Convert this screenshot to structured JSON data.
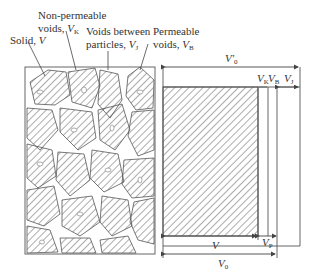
{
  "diagram": {
    "left_panel": {
      "title": "Particle packing (schematic)",
      "labels": {
        "solid": {
          "text": "Solid, ",
          "symbol": "V",
          "sub": ""
        },
        "non_permeable": {
          "line1": "Non-permeable",
          "line2": "voids, ",
          "symbol": "V",
          "sub": "K"
        },
        "voids_between": {
          "line1": "Voids between",
          "line2": "particles, ",
          "symbol": "V",
          "sub": "J"
        },
        "permeable": {
          "line1": "Permeable",
          "line2": "voids, ",
          "symbol": "V",
          "sub": "B"
        }
      }
    },
    "right_panel": {
      "top_dimension": {
        "symbol": "V'",
        "sub": "0"
      },
      "small_dimensions": [
        {
          "symbol": "V",
          "sub": "K"
        },
        {
          "symbol": "V",
          "sub": "B"
        },
        {
          "symbol": "V",
          "sub": "J"
        }
      ],
      "bottom_dimensions": [
        {
          "symbol": "V",
          "sub": ""
        },
        {
          "symbol": "V",
          "sub": "P"
        },
        {
          "symbol": "V",
          "sub": "0"
        }
      ]
    },
    "colors": {
      "line": "#555555",
      "hatch": "#666666",
      "background": "#ffffff"
    }
  }
}
